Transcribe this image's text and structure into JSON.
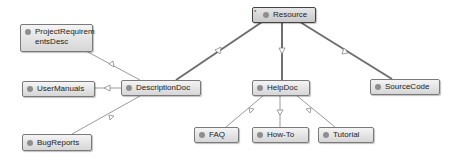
{
  "diagram": {
    "type": "class-hierarchy",
    "nodes": [
      {
        "id": "resource",
        "label": "Resource",
        "root": true
      },
      {
        "id": "descriptiondoc",
        "label": "DescriptionDoc"
      },
      {
        "id": "helpdoc",
        "label": "HelpDoc"
      },
      {
        "id": "sourcecode",
        "label": "SourceCode"
      },
      {
        "id": "projectrequirementsdesc",
        "label_line1": "ProjectRequirem",
        "label_line2": "entsDesc"
      },
      {
        "id": "usermanuals",
        "label": "UserManuals"
      },
      {
        "id": "bugreports",
        "label": "BugReports"
      },
      {
        "id": "faq",
        "label": "FAQ"
      },
      {
        "id": "howto",
        "label": "How-To"
      },
      {
        "id": "tutorial",
        "label": "Tutorial"
      }
    ],
    "edges": [
      {
        "from": "descriptiondoc",
        "to": "resource",
        "kind": "inheritance"
      },
      {
        "from": "helpdoc",
        "to": "resource",
        "kind": "inheritance"
      },
      {
        "from": "sourcecode",
        "to": "resource",
        "kind": "inheritance"
      },
      {
        "from": "projectrequirementsdesc",
        "to": "descriptiondoc",
        "kind": "inheritance"
      },
      {
        "from": "usermanuals",
        "to": "descriptiondoc",
        "kind": "inheritance"
      },
      {
        "from": "bugreports",
        "to": "descriptiondoc",
        "kind": "inheritance"
      },
      {
        "from": "faq",
        "to": "helpdoc",
        "kind": "inheritance"
      },
      {
        "from": "howto",
        "to": "helpdoc",
        "kind": "inheritance"
      },
      {
        "from": "tutorial",
        "to": "helpdoc",
        "kind": "inheritance"
      }
    ],
    "colors": {
      "edge_primary": "#6e6e6e",
      "edge_secondary": "#9a9a9a",
      "node_dot": "#8e8e8e"
    }
  }
}
